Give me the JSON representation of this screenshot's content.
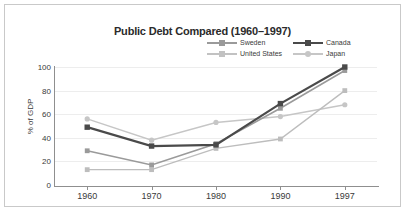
{
  "chart_data": {
    "type": "line",
    "title": "Public Debt Compared (1960–1997)",
    "xlabel": "",
    "ylabel": "% of GDP",
    "categories": [
      "1960",
      "1970",
      "1980",
      "1990",
      "1997"
    ],
    "x": [
      1960,
      1970,
      1980,
      1990,
      1997
    ],
    "ylim": [
      0,
      100
    ],
    "yticks": [
      0,
      20,
      40,
      60,
      80,
      100
    ],
    "grid": true,
    "legend_position": "top-right",
    "series": [
      {
        "name": "Sweden",
        "values": [
          29,
          17,
          35,
          65,
          97
        ],
        "color": "#9a9a9a",
        "marker": "square",
        "line_width": 1.6
      },
      {
        "name": "United States",
        "values": [
          13,
          13,
          31,
          39,
          80
        ],
        "color": "#bdbdbd",
        "marker": "square",
        "line_width": 1.4
      },
      {
        "name": "Canada",
        "values": [
          49,
          33,
          34,
          69,
          100
        ],
        "color": "#4a4a4a",
        "marker": "square",
        "line_width": 2.2
      },
      {
        "name": "Japan",
        "values": [
          56,
          38,
          53,
          58,
          68
        ],
        "color": "#c6c6c6",
        "marker": "circle",
        "line_width": 1.4
      }
    ]
  },
  "legend": {
    "entries": [
      {
        "label": "Sweden",
        "color": "#9a9a9a",
        "marker": "sq",
        "thick": false
      },
      {
        "label": "Canada",
        "color": "#4a4a4a",
        "marker": "sq",
        "thick": true
      },
      {
        "label": "United States",
        "color": "#c2c2c2",
        "marker": "sq",
        "thick": false
      },
      {
        "label": "Japan",
        "color": "#c6c6c6",
        "marker": "ci",
        "thick": false
      }
    ]
  },
  "colors": {
    "frame_border": "#c9c9c9",
    "axis": "#8f8f8f",
    "gridline": "#ededed",
    "text": "#3a3a3a",
    "title": "#2b2b2b",
    "background": "#ffffff"
  }
}
